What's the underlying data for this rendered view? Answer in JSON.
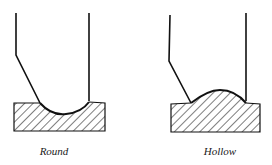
{
  "figures": [
    {
      "id": "round",
      "label": "Round",
      "description": "Tool with rounded tip forming a concave groove in hatched workpiece"
    },
    {
      "id": "hollow",
      "label": "Hollow",
      "description": "Tool with hollow tip forming a convex bead on hatched workpiece"
    }
  ],
  "colors": {
    "stroke": "#111111",
    "background": "#ffffff"
  }
}
